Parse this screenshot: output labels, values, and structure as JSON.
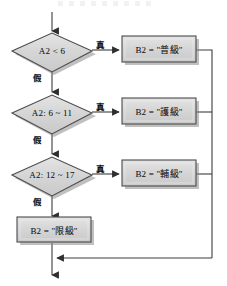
{
  "diagram": {
    "type": "flowchart",
    "colors": {
      "node_fill": "#d4d4d4",
      "node_fill_top": "#e2e2e2",
      "node_stroke": "#4a4a4a",
      "shadow": "#8d8d8d",
      "line": "#3c3c3c",
      "text": "#1a1a1a",
      "background": "#ffffff"
    },
    "entry_arrow": {
      "name": "entry-arrow"
    },
    "exit_arrow": {
      "name": "exit-arrow"
    },
    "decisions": [
      {
        "id": "decision-1",
        "label": "A2 < 6",
        "true_label": "真",
        "false_label": "假"
      },
      {
        "id": "decision-2",
        "label": "A2: 6 ~ 11",
        "true_label": "真",
        "false_label": "假"
      },
      {
        "id": "decision-3",
        "label": "A2: 12 ~ 17",
        "true_label": "真",
        "false_label": "假"
      }
    ],
    "processes": [
      {
        "id": "process-1",
        "label": "B2 = \"普級\""
      },
      {
        "id": "process-2",
        "label": "B2 = \"護級\""
      },
      {
        "id": "process-3",
        "label": "B2 = \"輔級\""
      },
      {
        "id": "process-4",
        "label": "B2 = \"限級\""
      }
    ]
  }
}
